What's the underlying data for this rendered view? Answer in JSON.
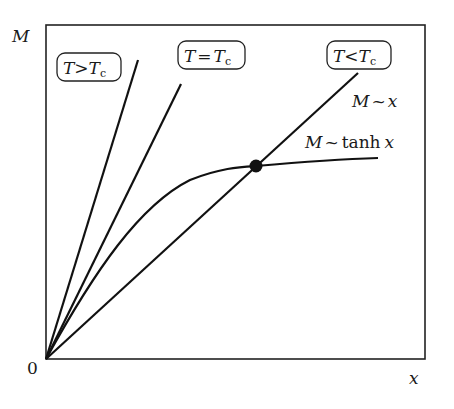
{
  "diagram": {
    "type": "magnetization graphical solution (mean-field)",
    "axes": {
      "y_label": "M",
      "x_label": "x",
      "origin_label": "0"
    },
    "lines": [
      {
        "id": "t-greater-tc",
        "label": "T>Tc",
        "label_parts": {
          "left": "T",
          "op": ">",
          "right": "T",
          "sub": "c"
        }
      },
      {
        "id": "t-equal-tc",
        "label": "T=Tc",
        "label_parts": {
          "left": "T",
          "op": "=",
          "right": "T",
          "sub": "c"
        }
      },
      {
        "id": "t-less-tc",
        "label": "T<Tc",
        "label_parts": {
          "left": "T",
          "op": "<",
          "right": "T",
          "sub": "c"
        }
      }
    ],
    "curve_labels": {
      "linear": {
        "M": "M",
        "tilde": "~",
        "rhs": "x"
      },
      "tanh": {
        "M": "M",
        "tilde": "~",
        "fn": "tanh",
        "rhs": "x"
      }
    },
    "intersection_point": "non-trivial solution (dot)"
  }
}
